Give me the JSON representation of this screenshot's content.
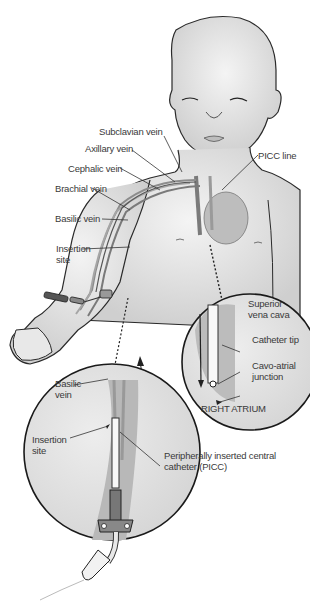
{
  "diagram": {
    "colors": {
      "skin": "#e6e6e6",
      "skin_shade": "#c9c9c9",
      "outline": "#1f1f1f",
      "vein": "#8a8a8a",
      "label_text": "#3a3a3a",
      "background": "#ffffff"
    },
    "labels": {
      "subclavian_vein": "Subclavian vein",
      "axillary_vein": "Axillary vein",
      "cephalic_vein": "Cephalic vein",
      "brachial_vein": "Brachial vein",
      "basilic_vein": "Basilic vein",
      "insertion_site": "Insertion site",
      "picc_line": "PICC line"
    },
    "inset_heart": {
      "superior_vena_cava": "Superior vena cava",
      "catheter_tip": "Catheter tip",
      "cavo_atrial_junction": "Cavo-atrial junction",
      "right_atrium": "RIGHT ATRIUM"
    },
    "inset_arm": {
      "basilic_vein": "Basilic vein",
      "insertion_site": "Insertion site",
      "picc": "Peripherally inserted central catheter (PICC)"
    }
  }
}
